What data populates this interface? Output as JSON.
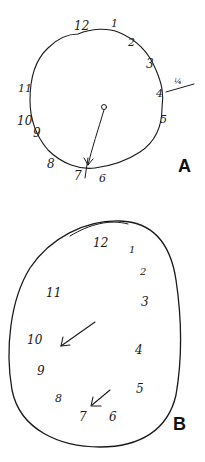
{
  "figure": {
    "panels": [
      {
        "label": "A",
        "numbers": [
          "12",
          "1",
          "2",
          "3",
          "4",
          "5",
          "6",
          "7",
          "8",
          "9",
          "10",
          "11"
        ],
        "annotation": "¼",
        "description": "Hand-drawn clock, numbers on rim, single hand pointing to 7"
      },
      {
        "label": "B",
        "numbers": [
          "12",
          "1",
          "2",
          "3",
          "4",
          "5",
          "6",
          "7",
          "8",
          "9",
          "10",
          "11"
        ],
        "description": "Hand-drawn egg-shaped clock with two arrows"
      }
    ]
  }
}
